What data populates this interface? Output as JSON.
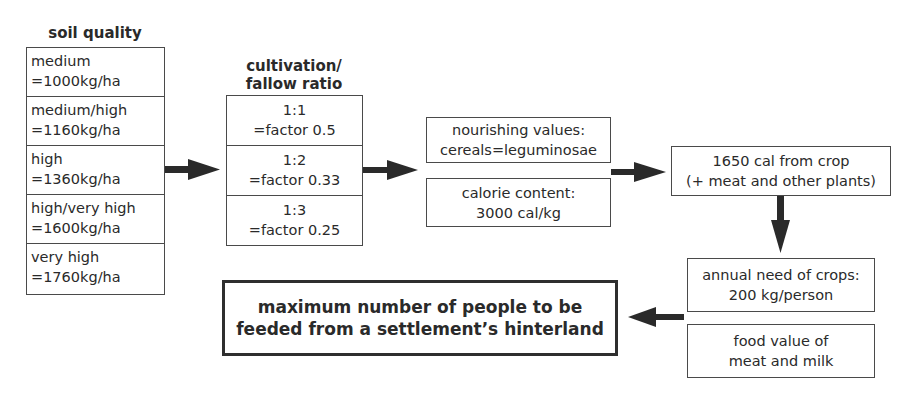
{
  "diagram": {
    "soil_quality": {
      "title": "soil quality",
      "rows": [
        {
          "label": "medium",
          "value": "=1000kg/ha"
        },
        {
          "label": "medium/high",
          "value": "=1160kg/ha"
        },
        {
          "label": "high",
          "value": "=1360kg/ha"
        },
        {
          "label": "high/very high",
          "value": "=1600kg/ha"
        },
        {
          "label": "very high",
          "value": "=1760kg/ha"
        }
      ]
    },
    "cultivation": {
      "title_line1": "cultivation/",
      "title_line2": "fallow ratio",
      "rows": [
        {
          "ratio": "1:1",
          "factor": "=factor 0.5"
        },
        {
          "ratio": "1:2",
          "factor": "=factor 0.33"
        },
        {
          "ratio": "1:3",
          "factor": "=factor 0.25"
        }
      ]
    },
    "nourishing": {
      "line1": "nourishing values:",
      "line2": "cereals=leguminosae"
    },
    "calorie": {
      "line1": "calorie content:",
      "line2": "3000 cal/kg"
    },
    "crop_cal": {
      "line1": "1650 cal from crop",
      "line2": "(+ meat and other plants)"
    },
    "annual_need": {
      "line1": "annual need of crops:",
      "line2": "200 kg/person"
    },
    "food_value": {
      "line1": "food value of",
      "line2": "meat and milk"
    },
    "result": {
      "line1": "maximum number of people to be",
      "line2": "feeded from a settlement’s hinterland"
    },
    "colors": {
      "border": "#4a4a4a",
      "arrow": "#2a2a2a",
      "text": "#2a2a2a"
    }
  }
}
